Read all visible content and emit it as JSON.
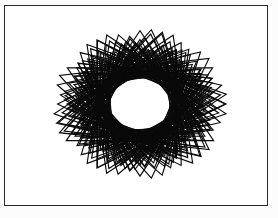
{
  "figure": {
    "background_color": "#ffffff",
    "paper_color": "#fcfcfc",
    "frame": {
      "border_color": "#2a2a2c",
      "border_width_px": 1,
      "x": 4,
      "y": 5,
      "width": 264,
      "height": 201
    },
    "ink_color": "#0a0a0a",
    "hole_color": "#ffffff"
  },
  "chart_data": {
    "type": "line",
    "subtitle": "",
    "xlabel": "",
    "ylabel": "",
    "xlim": [
      0,
      264
    ],
    "ylim": [
      0,
      201
    ],
    "grid": false,
    "legend": "none",
    "annotations": [],
    "tick_labels_x": [],
    "tick_labels_y": [],
    "pattern": {
      "shape": "triangle",
      "sides": 3,
      "count": 48,
      "center_x": 136,
      "center_y": 99,
      "radius_min": 62,
      "radius_max": 86,
      "rotation_step_deg": 7.5,
      "stroke_width": 1.15,
      "hole_rx": 23,
      "hole_ry": 18,
      "hole_cx": 136,
      "hole_cy": 100
    }
  }
}
